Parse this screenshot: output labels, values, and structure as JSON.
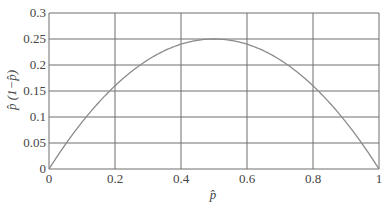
{
  "chart_data": {
    "type": "line",
    "title": "",
    "xlabel": "p̂",
    "ylabel": "p̂ (1−p̂)",
    "xlim": [
      0,
      1
    ],
    "ylim": [
      0,
      0.3
    ],
    "xticks": [
      0,
      0.2,
      0.4,
      0.6,
      0.8,
      1
    ],
    "xtick_labels": [
      "0",
      "0.2",
      "0.4",
      "0.6",
      "0.8",
      "1"
    ],
    "yticks": [
      0,
      0.05,
      0.1,
      0.15,
      0.2,
      0.25,
      0.3
    ],
    "ytick_labels": [
      "0",
      "0.05",
      "0.1",
      "0.15",
      "0.2",
      "0.25",
      "0.3"
    ],
    "grid": true,
    "legend": null,
    "series": [
      {
        "name": "p̂(1−p̂)",
        "x": [
          0,
          0.05,
          0.1,
          0.15,
          0.2,
          0.25,
          0.3,
          0.35,
          0.4,
          0.45,
          0.5,
          0.55,
          0.6,
          0.65,
          0.7,
          0.75,
          0.8,
          0.85,
          0.9,
          0.95,
          1
        ],
        "values": [
          0,
          0.0475,
          0.09,
          0.1275,
          0.16,
          0.1875,
          0.21,
          0.2275,
          0.24,
          0.2475,
          0.25,
          0.2475,
          0.24,
          0.2275,
          0.21,
          0.1875,
          0.16,
          0.1275,
          0.09,
          0.0475,
          0
        ],
        "color": "#8a8a8a"
      }
    ],
    "colors": {
      "grid": "#6e6e6e",
      "curve": "#8a8a8a",
      "text": "#444444"
    }
  }
}
